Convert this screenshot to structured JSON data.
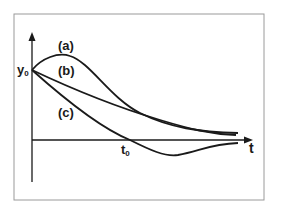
{
  "figure": {
    "y_axis_label": "y",
    "y_axis_label_sub": "0",
    "x_axis_label": "t",
    "t0_label": "t",
    "t0_label_sub": "0",
    "curves": [
      {
        "id": "a",
        "label": "(a)",
        "description": "rises above y0 then decays toward t-axis"
      },
      {
        "id": "b",
        "label": "(b)",
        "description": "monotonic decay from y0 toward t-axis"
      },
      {
        "id": "c",
        "label": "(c)",
        "description": "decays from y0, crosses t-axis at t0, undershoots then returns toward axis"
      }
    ],
    "colors": {
      "line": "#1a1a1a",
      "frame": "#9a9a9a",
      "background": "#ffffff"
    }
  }
}
